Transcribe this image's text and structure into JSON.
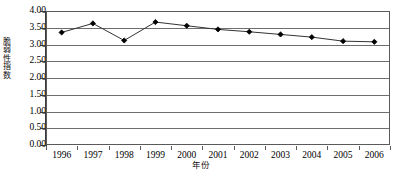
{
  "chart_data": {
    "type": "line",
    "title": "",
    "subtitle": "",
    "xlabel": "年份",
    "ylabel": "脆弱性指数",
    "categories": [
      "1996",
      "1997",
      "1998",
      "1999",
      "2000",
      "2001",
      "2002",
      "2003",
      "2004",
      "2005",
      "2006"
    ],
    "x": [
      1996,
      1997,
      1998,
      1999,
      2000,
      2001,
      2002,
      2003,
      2004,
      2005,
      2006
    ],
    "values": [
      3.36,
      3.63,
      3.12,
      3.67,
      3.56,
      3.45,
      3.38,
      3.3,
      3.22,
      3.1,
      3.08
    ],
    "series": [
      {
        "name": "脆弱性指数",
        "values": [
          3.36,
          3.63,
          3.12,
          3.67,
          3.56,
          3.45,
          3.38,
          3.3,
          3.22,
          3.1,
          3.08
        ],
        "marker": "diamond",
        "line_color": "#333333",
        "marker_color": "#000000"
      }
    ],
    "ylim": [
      0.0,
      4.0
    ],
    "ytick_values": [
      0.0,
      0.5,
      1.0,
      1.5,
      2.0,
      2.5,
      3.0,
      3.5,
      4.0
    ],
    "ytick_labels": [
      "0.00",
      "0.50",
      "1.00",
      "1.50",
      "2.00",
      "2.50",
      "3.00",
      "3.50",
      "4.00"
    ],
    "grid": true,
    "grid_axis": "y",
    "grid_color": "#6e6e6e",
    "legend": false,
    "legend_position": "none",
    "plot_border": true,
    "plot_border_color": "#5a5a5a",
    "background": "#ffffff"
  }
}
